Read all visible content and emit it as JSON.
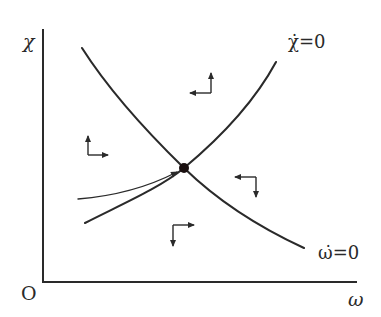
{
  "diagram": {
    "axes": {
      "y_label": "χ",
      "x_label": "ω",
      "origin_label": "O"
    },
    "curves": [
      {
        "id": "omega-dot-zero",
        "label": "ω̇=0",
        "shape": "downward sloping, convex"
      },
      {
        "id": "chi-dot-zero",
        "label": "χ̇=0",
        "shape": "upward sloping, convex"
      }
    ],
    "equilibrium": {
      "label": "steady state",
      "marker": "filled dot at intersection"
    },
    "saddle_path": {
      "description": "stable arm approaching equilibrium from lower-left",
      "arrow": "toward equilibrium"
    },
    "direction_arrows": [
      {
        "region": "left",
        "vertical": "up",
        "horizontal": "right"
      },
      {
        "region": "top",
        "vertical": "up",
        "horizontal": "left"
      },
      {
        "region": "right",
        "vertical": "down",
        "horizontal": "left"
      },
      {
        "region": "bottom",
        "vertical": "down",
        "horizontal": "right"
      }
    ],
    "colors": {
      "ink": "#2a2a2a",
      "background": "#ffffff"
    }
  }
}
